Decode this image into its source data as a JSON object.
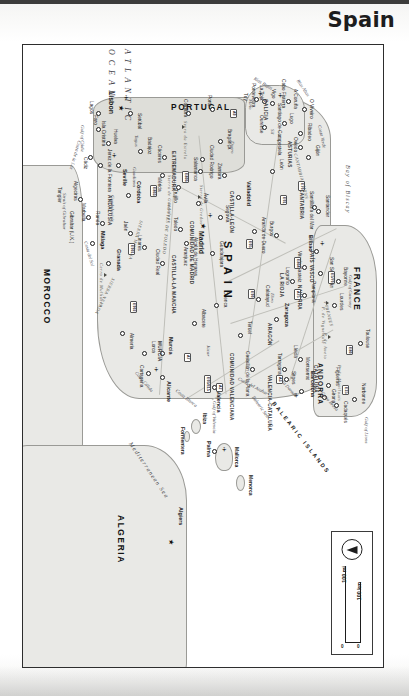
{
  "page": {
    "title": "Spain",
    "map_type": "political-reference-map",
    "orientation_note": "north-to-left"
  },
  "scale": {
    "miles_label": "100 mi",
    "km_label": "100 km",
    "zero_left": "0",
    "zero_right": "0",
    "compass": "north-arrow"
  },
  "countries": [
    {
      "name": "SPAIN",
      "style": "spaced"
    },
    {
      "name": "PORTUGAL",
      "style": "normal"
    },
    {
      "name": "FRANCE",
      "style": "normal"
    },
    {
      "name": "ANDORRA",
      "style": "small"
    },
    {
      "name": "ALGERIA",
      "style": "normal"
    },
    {
      "name": "MOROCCO",
      "style": "normal"
    }
  ],
  "capitals": [
    {
      "name": "Madrid",
      "country": "Spain"
    },
    {
      "name": "Lisbon",
      "country": "Portugal"
    },
    {
      "name": "Algiers",
      "country": "Algeria"
    }
  ],
  "cities": [
    "Barcelona",
    "Valencia",
    "Seville",
    "Zaragoza",
    "Málaga",
    "Bilbao",
    "Alicante",
    "Córdoba",
    "Valladolid",
    "Vigo",
    "Gijón",
    "Murcia",
    "Palma",
    "Granada",
    "Oviedo",
    "Santander",
    "Pamplona",
    "San Sebastián",
    "Burgos",
    "León",
    "Salamanca",
    "Cáceres",
    "Badajoz",
    "Toledo",
    "Cuenca",
    "Teruel",
    "Castellón de la Plana",
    "Tarragona",
    "Lleida",
    "Girona",
    "Figueras",
    "Cadaqués",
    "Sitges",
    "Montserrat",
    "Logroño",
    "Vitoria-Gasteiz",
    "Calatayud",
    "Guadalajara",
    "Alcalá de Henares",
    "Aranjuez",
    "Ciudad Real",
    "Albacete",
    "Cartagena",
    "Lorca",
    "Almería",
    "Jaén",
    "Linares",
    "Ronda",
    "Marbella",
    "Algeciras",
    "Gibraltar (U.K.)",
    "Tangier",
    "Cádiz",
    "Jerez de la Frontera",
    "Huelva",
    "Isla Cristina",
    "Mérida",
    "Trujillo",
    "Ciudad Rodrigo",
    "Ávila",
    "Segovia",
    "Aranda de Duero",
    "Zamora",
    "Bragança",
    "Porto",
    "Coimbra",
    "Setúbal",
    "Faro",
    "Lagos",
    "Santiago de Compostela",
    "A Coruña",
    "Pontevedra",
    "La Toja",
    "Ribadeo",
    "Lugo",
    "Ourense",
    "O Viveiro",
    "Cabo Fisterra",
    "Tuy",
    "Santillana del Mar",
    "Narbonne",
    "Toulouse",
    "Bayonne",
    "Lourdes",
    "Mallorca",
    "Menorca",
    "Ibiza",
    "Formentera"
  ],
  "regions": [
    "GALICIA",
    "ASTURIAS",
    "CANTABRIA",
    "PAÍS VASCO",
    "NAVARRA",
    "LA RIOJA",
    "ARAGÓN",
    "CATALUÑA",
    "COMUNIDAD VALENCIANA",
    "MURCIA",
    "ANDALUSIA",
    "EXTREMADURA",
    "CASTILLA-LA MANCHA",
    "CASTILLA-LEÓN",
    "COMUNIDAD DE MADRID",
    "VALENCIA-CATALUÑA"
  ],
  "water_features": [
    {
      "name": "ATLANTIC OCEAN",
      "kind": "ocean"
    },
    {
      "name": "Mediterranean Sea",
      "kind": "sea"
    },
    {
      "name": "Balearic Sea",
      "kind": "sea"
    },
    {
      "name": "Bay of Biscay",
      "kind": "bay"
    },
    {
      "name": "Gulf of Lions",
      "kind": "gulf"
    },
    {
      "name": "Gulf of Gascony",
      "kind": "gulf"
    },
    {
      "name": "Gulf of Valencia",
      "kind": "gulf"
    },
    {
      "name": "Gulf of Cádiz",
      "kind": "gulf"
    },
    {
      "name": "Strait of Gibraltar",
      "kind": "strait"
    },
    {
      "name": "Tagus",
      "kind": "river"
    },
    {
      "name": "Duero",
      "kind": "river"
    },
    {
      "name": "Ebro",
      "kind": "river"
    },
    {
      "name": "Júcar",
      "kind": "river"
    },
    {
      "name": "Guadalquivir",
      "kind": "river"
    },
    {
      "name": "Guadiana",
      "kind": "river"
    },
    {
      "name": "Sil",
      "kind": "river"
    },
    {
      "name": "Miño",
      "kind": "river"
    }
  ],
  "coastlines": [
    "Costa Brava",
    "Costa Dorada",
    "Costa del Azahar",
    "Costa Blanca",
    "Costa Cálida",
    "Costa del Sol",
    "Costa de la Luz",
    "Costa Verde",
    "Rías Bajas",
    "Rías Altas"
  ],
  "mountains": [
    "PYRENEES",
    "CANTABRIAN MTNS",
    "SIERRA MORENA",
    "SIERRA NEVADA",
    "MONTES DE TOLEDO",
    "Sierra de Gredos",
    "Sierra de Guadalupe",
    "Serra da Estrela",
    "P. de Montlouis",
    "P. de Aneto",
    "Cerro de Mulhacén",
    "P. de Vignemale"
  ],
  "islands": {
    "group": "BALEARIC ISLANDS",
    "members": [
      "Mallorca",
      "Menorca",
      "Ibiza",
      "Formentera"
    ]
  },
  "road_badges": [
    "E15",
    "E80",
    "E5/70",
    "E70",
    "E01",
    "E804",
    "E05",
    "E90",
    "E901",
    "E902",
    "E803",
    "E806",
    "E05/E15",
    "A75",
    "A2",
    "A9",
    "A3",
    "A7"
  ]
}
